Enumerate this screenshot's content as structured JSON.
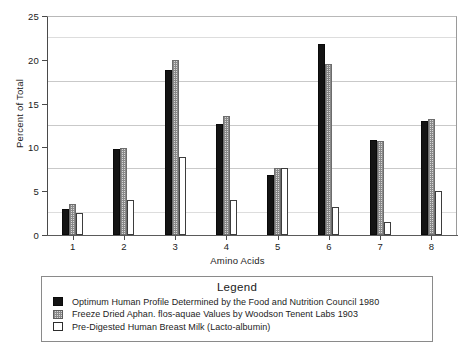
{
  "chart_data": {
    "type": "bar",
    "title": "",
    "xlabel": "Amino Acids",
    "ylabel": "Percent of Total",
    "categories": [
      "1",
      "2",
      "3",
      "4",
      "5",
      "6",
      "7",
      "8"
    ],
    "ylim": [
      0,
      25
    ],
    "yticks": [
      0,
      5,
      10,
      15,
      20,
      25
    ],
    "gridlines": [
      2.5,
      7.5,
      12.5,
      17.5,
      22.5
    ],
    "grid": true,
    "legend_position": "below-plot",
    "legend_title": "Legend",
    "series": [
      {
        "name": "Optimum Human Profile Determined by the Food and Nutrition Council 1980",
        "swatch": "solid-black",
        "values": [
          3.0,
          9.8,
          18.8,
          12.7,
          6.8,
          21.8,
          10.8,
          13.0
        ]
      },
      {
        "name": "Freeze Dried Aphan. flos-aquae Values by Woodson Tenent Labs 1903",
        "swatch": "stippled-gray",
        "values": [
          3.5,
          9.9,
          20.0,
          13.6,
          7.7,
          19.5,
          10.7,
          13.2
        ]
      },
      {
        "name": "Pre-Digested Human Breast Milk (Lacto-albumin)",
        "swatch": "white-outline",
        "values": [
          2.5,
          4.0,
          8.9,
          4.0,
          7.6,
          3.2,
          1.5,
          5.0
        ]
      }
    ]
  }
}
